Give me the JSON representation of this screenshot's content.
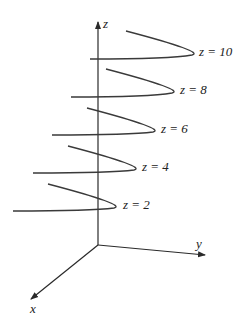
{
  "figure": {
    "axes": {
      "x_label": "x",
      "y_label": "y",
      "z_label": "z"
    },
    "traces": [
      {
        "level": 10,
        "label": "z = 10"
      },
      {
        "level": 8,
        "label": "z = 8"
      },
      {
        "level": 6,
        "label": "z = 6"
      },
      {
        "level": 4,
        "label": "z = 4"
      },
      {
        "level": 2,
        "label": "z = 2"
      }
    ],
    "colors": {
      "stroke": "#3a3a3a",
      "background": "#ffffff"
    }
  }
}
